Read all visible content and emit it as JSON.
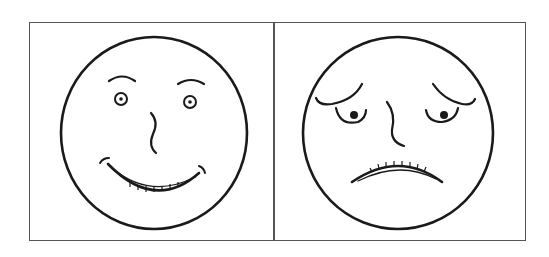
{
  "figure": {
    "panels": [
      {
        "id": "happy",
        "expression": "happy-face",
        "description": "Smiling face with raised eyebrows, ringed eyes and a wide toothy smile"
      },
      {
        "id": "sad",
        "expression": "sad-face",
        "description": "Worried/sad face with drooping brows, heavy-lidded eyes and a toothy frown"
      }
    ],
    "colors": {
      "line": "#1a1a1a",
      "frame": "#555555",
      "background": "#ffffff"
    }
  }
}
